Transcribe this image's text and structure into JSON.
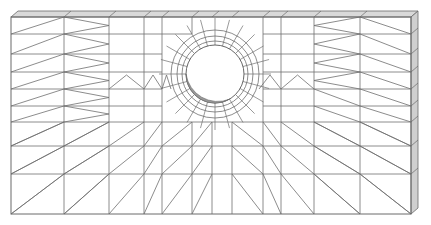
{
  "figure": {
    "title": "",
    "colors": {
      "background": "#ffffff",
      "mesh_line": "#6e6e6e",
      "top_face": "#d9d9d9",
      "side_face": "#cfcfcf",
      "hole_shade": "#9a9a9a"
    },
    "geometry": {
      "front_left": 11,
      "front_right": 411,
      "front_top": 17,
      "front_bottom": 214,
      "depth_dx": 7,
      "depth_dy": -6,
      "hole": {
        "cx": 215,
        "cy": 74,
        "r": 29,
        "ring_radii": [
          33,
          38,
          44
        ]
      }
    },
    "columns": [
      11,
      64,
      109,
      144,
      162,
      192,
      212,
      232,
      263,
      281,
      314,
      360,
      411
    ],
    "rows": [
      17,
      34,
      54,
      72,
      89,
      106,
      122,
      146,
      174,
      214
    ]
  }
}
